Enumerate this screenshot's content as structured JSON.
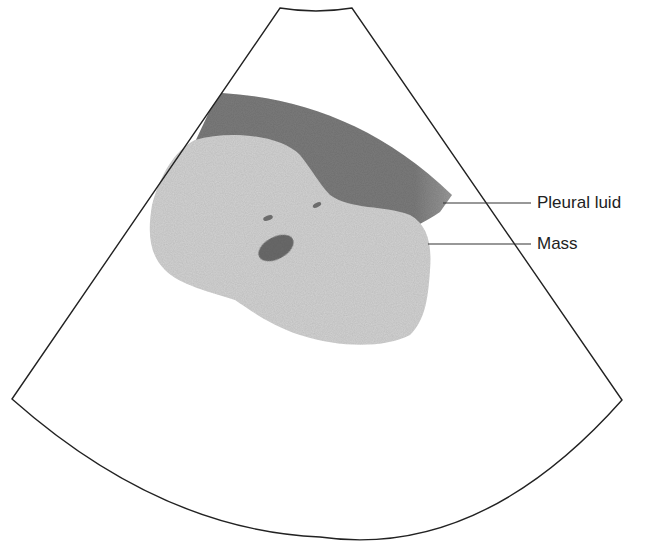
{
  "diagram": {
    "type": "ultrasound-sector-schematic",
    "labels": {
      "pleural_fluid": "Pleural luid",
      "mass": "Mass"
    },
    "colors": {
      "outline": "#222222",
      "mass": "#d3d3d3",
      "pleural_fluid": "#7b7b7b",
      "lesion_spots": "#6c6c6c",
      "background": "#ffffff"
    }
  }
}
